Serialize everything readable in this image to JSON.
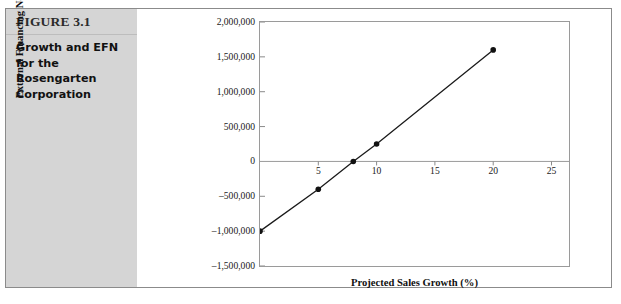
{
  "figure": {
    "number_label": "FIGURE 3.1",
    "caption": "Growth and EFN for the Rosengarten Corporation",
    "panel_color": "#d5d5d5",
    "border_color": "#8b8b8b"
  },
  "chart_data": {
    "type": "line",
    "title": "",
    "xlabel": "Projected Sales Growth (%)",
    "ylabel": "External Financing Needed ($)",
    "x": [
      0,
      5,
      8,
      10,
      20
    ],
    "values": [
      -1000000,
      -400000,
      0,
      250000,
      1600000
    ],
    "series": [
      {
        "name": "External Financing Needed",
        "x": [
          0,
          5,
          8,
          10,
          20
        ],
        "values": [
          -1000000,
          -400000,
          0,
          250000,
          1600000
        ]
      }
    ],
    "xlim": [
      0,
      26.5
    ],
    "ylim": [
      -1500000,
      2000000
    ],
    "xticks": [
      5,
      10,
      15,
      20,
      25
    ],
    "xtick_labels": [
      "5",
      "10",
      "15",
      "20",
      "25"
    ],
    "yticks": [
      2000000,
      1500000,
      1000000,
      500000,
      0,
      -500000,
      -1000000,
      -1500000
    ],
    "ytick_labels": [
      "2,000,000",
      "1,500,000",
      "1,000,000",
      "500,000",
      "0",
      "–500,000",
      "–1,000,000",
      "–1,500,000"
    ],
    "grid": false,
    "legend": "none",
    "line_color": "#1a1a1a",
    "marker": "circle",
    "marker_color": "#111111",
    "zero_line": true
  }
}
